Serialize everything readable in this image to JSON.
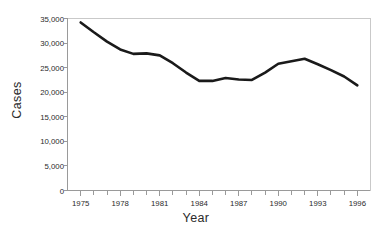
{
  "chart_data": {
    "type": "line",
    "title": "",
    "xlabel": "Year",
    "ylabel": "Cases",
    "x": [
      1975,
      1976,
      1977,
      1978,
      1979,
      1980,
      1981,
      1982,
      1983,
      1984,
      1985,
      1986,
      1987,
      1988,
      1989,
      1990,
      1991,
      1992,
      1993,
      1994,
      1995,
      1996
    ],
    "values": [
      34200,
      32200,
      30300,
      28700,
      27800,
      27900,
      27500,
      25900,
      24000,
      22300,
      22300,
      22900,
      22600,
      22500,
      24000,
      25800,
      26300,
      26800,
      25700,
      24500,
      23200,
      21400
    ],
    "series": [
      {
        "name": "Cases",
        "values": [
          34200,
          32200,
          30300,
          28700,
          27800,
          27900,
          27500,
          25900,
          24000,
          22300,
          22300,
          22900,
          22600,
          22500,
          24000,
          25800,
          26300,
          26800,
          25700,
          24500,
          23200,
          21400
        ]
      }
    ],
    "xlim": [
      1974,
      1997
    ],
    "ylim": [
      0,
      35000
    ],
    "ytick_values": [
      0,
      5000,
      10000,
      15000,
      20000,
      25000,
      30000,
      35000
    ],
    "ytick_labels": [
      "0",
      "5,000",
      "10,000",
      "15,000",
      "20,000",
      "25,000",
      "30,000",
      "35,000"
    ],
    "xtick_values": [
      1975,
      1978,
      1981,
      1984,
      1987,
      1990,
      1993,
      1996
    ],
    "xtick_labels": [
      "1975",
      "1978",
      "1981",
      "1984",
      "1987",
      "1990",
      "1993",
      "1996"
    ],
    "xminor_values": [
      1975,
      1976,
      1977,
      1978,
      1979,
      1980,
      1981,
      1982,
      1983,
      1984,
      1985,
      1986,
      1987,
      1988,
      1989,
      1990,
      1991,
      1992,
      1993,
      1994,
      1995,
      1996
    ],
    "grid": false,
    "legend": "none",
    "colors": {
      "line": "#1a1a1a",
      "axis": "#9a9a9a",
      "background": "#ffffff",
      "text": "#2b2b2b"
    },
    "line_width": 2.6
  }
}
